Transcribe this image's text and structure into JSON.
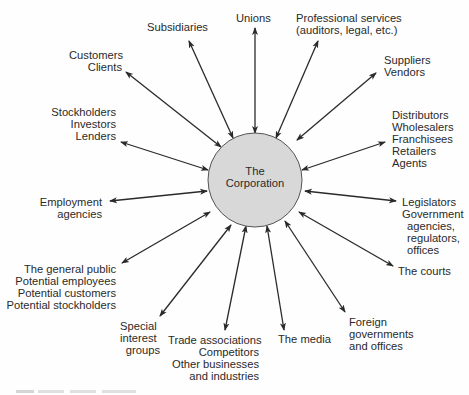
{
  "diagram": {
    "center": {
      "lines": [
        "The",
        "Corporation"
      ],
      "fill": "#d8d8d8",
      "stroke": "#555555"
    },
    "stakeholders": [
      {
        "id": "subsidiaries",
        "lines": [
          "Subsidiaries"
        ]
      },
      {
        "id": "unions",
        "lines": [
          "Unions"
        ]
      },
      {
        "id": "professional-services",
        "lines": [
          "Professional services",
          "(auditors, legal, etc.)"
        ]
      },
      {
        "id": "customers",
        "lines": [
          "Customers",
          "Clients"
        ]
      },
      {
        "id": "suppliers",
        "lines": [
          "Suppliers",
          "Vendors"
        ]
      },
      {
        "id": "stockholders",
        "lines": [
          "Stockholders",
          "Investors",
          "Lenders"
        ]
      },
      {
        "id": "distributors",
        "lines": [
          "Distributors",
          "Wholesalers",
          "Franchisees",
          "Retailers",
          "Agents"
        ]
      },
      {
        "id": "employment-agencies",
        "lines": [
          "Employment",
          "agencies"
        ]
      },
      {
        "id": "legislators",
        "lines": [
          "Legislators",
          "Government",
          "agencies,",
          "regulators,",
          "offices"
        ]
      },
      {
        "id": "general-public",
        "lines": [
          "The general public",
          "Potential employees",
          "Potential customers",
          "Potential stockholders"
        ]
      },
      {
        "id": "courts",
        "lines": [
          "The courts"
        ]
      },
      {
        "id": "special-interest",
        "lines": [
          "Special",
          "interest",
          "groups"
        ]
      },
      {
        "id": "trade-associations",
        "lines": [
          "Trade associations",
          "Competitors",
          "Other businesses",
          "and industries"
        ]
      },
      {
        "id": "media",
        "lines": [
          "The media"
        ]
      },
      {
        "id": "foreign-governments",
        "lines": [
          "Foreign",
          "governments",
          "and offices"
        ]
      }
    ],
    "arrow_style": "double-headed",
    "line_color": "#2a2a2a"
  }
}
